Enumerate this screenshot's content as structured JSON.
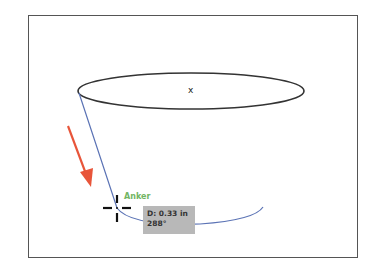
{
  "artboard": {
    "center_mark": "x"
  },
  "snap_hint": {
    "label": "Anker",
    "color": "#72b563"
  },
  "measurement_tooltip": {
    "distance": "D: 0.33 in",
    "angle": "288°"
  },
  "colors": {
    "path_stroke": "#5b73b5",
    "annotation_arrow": "#e8553a",
    "ellipse_stroke": "#333333",
    "tooltip_bg": "#b8b8b8"
  }
}
